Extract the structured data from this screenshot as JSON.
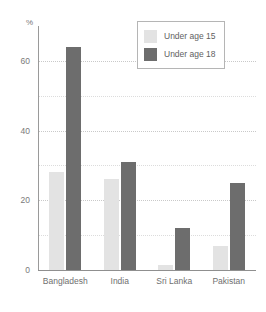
{
  "chart_data": {
    "type": "bar",
    "title": "",
    "subtitle": "",
    "xlabel": "",
    "ylabel": "%",
    "ylim": [
      0,
      70
    ],
    "yticks": [
      0,
      20,
      40,
      60
    ],
    "ytick_labels": [
      "0",
      "20",
      "40",
      "60"
    ],
    "minor_gridlines": [
      10,
      30,
      50
    ],
    "grid": true,
    "legend_position": "top-right",
    "categories": [
      "Bangladesh",
      "India",
      "Sri Lanka",
      "Pakistan"
    ],
    "series": [
      {
        "name": "Under age 15",
        "color": "#e3e3e3",
        "values": [
          28,
          26,
          1.5,
          7
        ]
      },
      {
        "name": "Under age 18",
        "color": "#6d6d6d",
        "values": [
          64,
          31,
          12,
          25
        ]
      }
    ]
  },
  "legend": {
    "items": [
      {
        "label": "Under age 15",
        "swatch": "light"
      },
      {
        "label": "Under age 18",
        "swatch": "dark"
      }
    ]
  },
  "colors": {
    "light_bar": "#e3e3e3",
    "dark_bar": "#6d6d6d",
    "gridline": "#c9c9c9",
    "axis": "#8f8f8f",
    "text": "#6f6f6f",
    "background": "#ffffff"
  }
}
